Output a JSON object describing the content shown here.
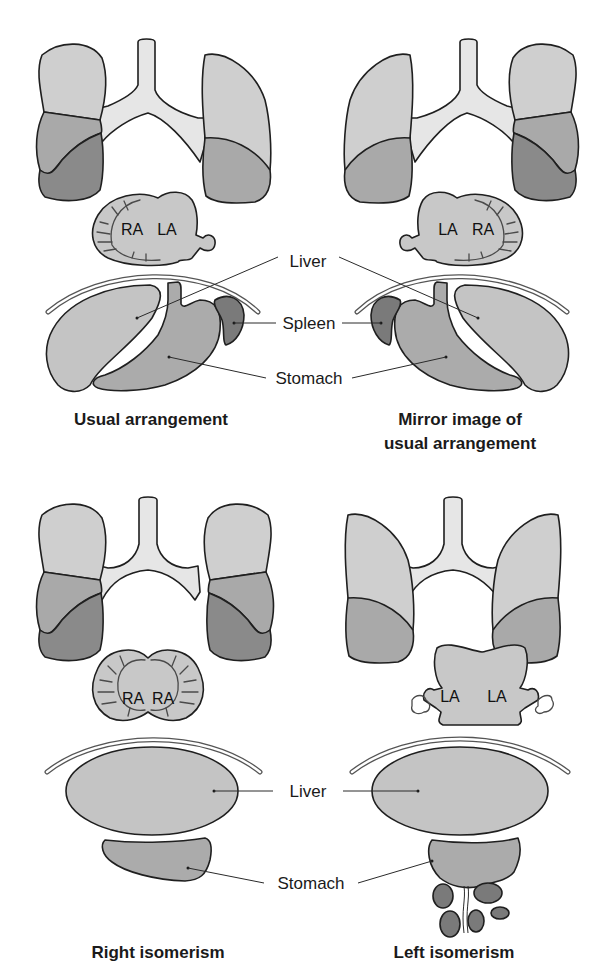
{
  "figure": {
    "type": "anatomical-diagram",
    "panels": [
      {
        "id": "usual",
        "title_lines": [
          "Usual arrangement"
        ],
        "atria": [
          "RA",
          "LA"
        ],
        "lungs": {
          "left_side_lobes": 3,
          "right_side_lobes": 2
        },
        "spleen": "single, on patient's left"
      },
      {
        "id": "mirror",
        "title_lines": [
          "Mirror image of",
          "usual arrangement"
        ],
        "atria": [
          "LA",
          "RA"
        ],
        "lungs": {
          "left_side_lobes": 2,
          "right_side_lobes": 3
        },
        "spleen": "single, on patient's right"
      },
      {
        "id": "right-isomerism",
        "title_lines": [
          "Right isomerism"
        ],
        "atria": [
          "RA",
          "RA"
        ],
        "lungs": {
          "left_side_lobes": 3,
          "right_side_lobes": 3
        },
        "spleen": "absent"
      },
      {
        "id": "left-isomerism",
        "title_lines": [
          "Left isomerism"
        ],
        "atria": [
          "LA",
          "LA"
        ],
        "lungs": {
          "left_side_lobes": 2,
          "right_side_lobes": 2
        },
        "spleen": "multiple"
      }
    ]
  },
  "labels": {
    "top": {
      "liver": "Liver",
      "spleen": "Spleen",
      "stomach": "Stomach"
    },
    "bottom": {
      "liver": "Liver",
      "stomach": "Stomach"
    }
  },
  "colors": {
    "upper_lobe": "#cfcfcf",
    "middle_lobe": "#a9a9a9",
    "lower_lobe": "#8a8a8a",
    "airway": "#e6e6e6",
    "heart": "#c8c8c8",
    "liver": "#c4c4c4",
    "stomach": "#ababab",
    "spleen": "#7a7a7a",
    "outline": "#1f1f1f",
    "background": "#ffffff"
  }
}
